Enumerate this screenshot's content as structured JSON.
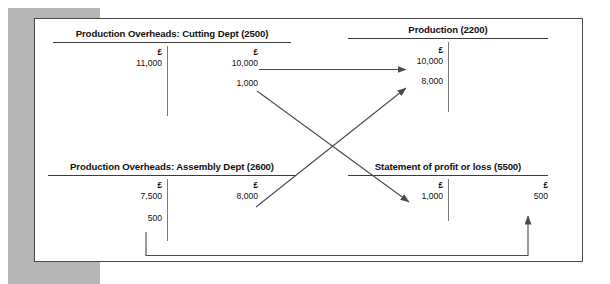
{
  "diagram": {
    "currency_symbol": "£",
    "accounts": [
      {
        "id": "production-overheads-cutting",
        "title": "Production Overheads: Cutting Dept (2500)",
        "debit": [
          {
            "currency": "£",
            "amount": "11,000"
          }
        ],
        "credit": [
          {
            "currency": "£",
            "amount": "10,000"
          },
          {
            "currency": "",
            "amount": "1,000"
          }
        ]
      },
      {
        "id": "production",
        "title": "Production (2200)",
        "debit": [
          {
            "currency": "£",
            "amount": "10,000"
          },
          {
            "currency": "",
            "amount": "8,000"
          }
        ],
        "credit": []
      },
      {
        "id": "production-overheads-assembly",
        "title": "Production Overheads: Assembly Dept (2600)",
        "debit": [
          {
            "currency": "£",
            "amount": "7,500"
          },
          {
            "currency": "",
            "amount": "500"
          }
        ],
        "credit": [
          {
            "currency": "£",
            "amount": "8,000"
          }
        ]
      },
      {
        "id": "statement-of-profit-or-loss",
        "title": "Statement of profit or loss (5500)",
        "debit": [
          {
            "currency": "£",
            "amount": "1,000"
          }
        ],
        "credit": [
          {
            "currency": "£",
            "amount": "500"
          }
        ]
      }
    ],
    "connectors": [
      {
        "id": "cutting-10000-to-production-10000",
        "label": "10,000",
        "from": "production-overheads-cutting.credit",
        "to": "production.debit",
        "style": "horizontal-arrow"
      },
      {
        "id": "cutting-1000-to-profit-loss-1000",
        "label": "1,000",
        "from": "production-overheads-cutting.credit",
        "to": "statement-of-profit-or-loss.debit",
        "style": "diagonal-arrow"
      },
      {
        "id": "assembly-8000-to-production-8000",
        "label": "8,000",
        "from": "production-overheads-assembly.credit",
        "to": "production.debit",
        "style": "diagonal-arrow"
      },
      {
        "id": "assembly-500-to-profit-loss-500",
        "label": "500",
        "from": "production-overheads-assembly.debit",
        "to": "statement-of-profit-or-loss.credit",
        "style": "elbow-arrow"
      }
    ]
  },
  "colors": {
    "line": "#3c3c3c",
    "divider": "#7a7a7a",
    "arrow": "#4a4a4a",
    "card_border": "#4a4a4a",
    "backdrop": "#b6b6b6",
    "text": "#111111"
  }
}
